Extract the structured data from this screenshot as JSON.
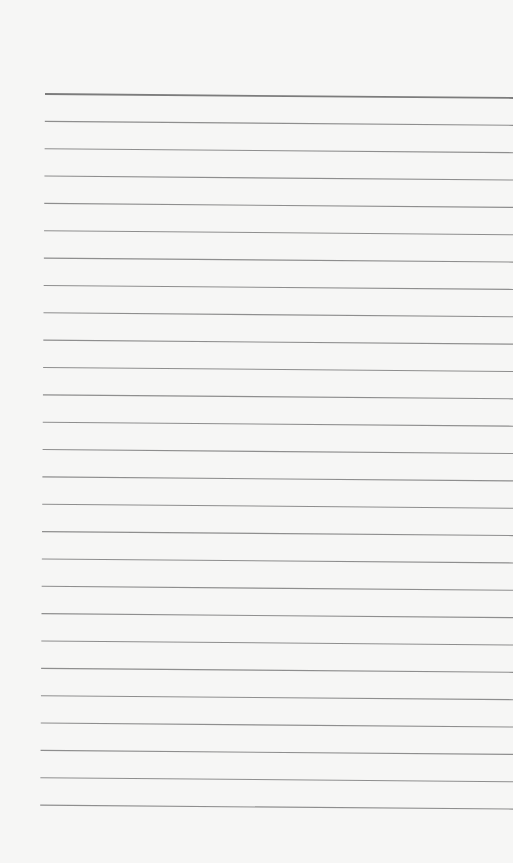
{
  "paper": {
    "type": "lined-notepaper",
    "background_color": "#f6f6f5",
    "line_color": "#8e8e8e",
    "header_line_color": "#7c7c7c",
    "line_count": 27,
    "first_line_y": 94,
    "line_spacing": 27.35,
    "line_start_x": 45,
    "line_end_x": 513,
    "slope_px": 4
  }
}
